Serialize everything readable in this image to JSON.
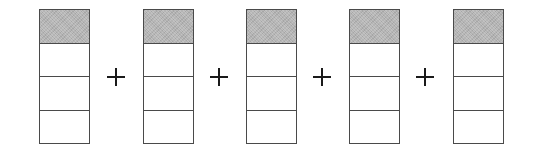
{
  "diagram": {
    "operator": "+",
    "colors": {
      "shade": "#b4b4b4",
      "border": "#4a4a4a",
      "operator": "#1a1a1a"
    },
    "bars": [
      {
        "parts": 4,
        "shaded": [
          0
        ],
        "left": 39
      },
      {
        "parts": 4,
        "shaded": [
          0
        ],
        "left": 143
      },
      {
        "parts": 4,
        "shaded": [
          0
        ],
        "left": 246
      },
      {
        "parts": 4,
        "shaded": [
          0
        ],
        "left": 349
      },
      {
        "parts": 4,
        "shaded": [
          0
        ],
        "left": 453
      }
    ],
    "operators": [
      {
        "symbol": "+",
        "center_x": 116
      },
      {
        "symbol": "+",
        "center_x": 219
      },
      {
        "symbol": "+",
        "center_x": 322
      },
      {
        "symbol": "+",
        "center_x": 425
      }
    ]
  }
}
